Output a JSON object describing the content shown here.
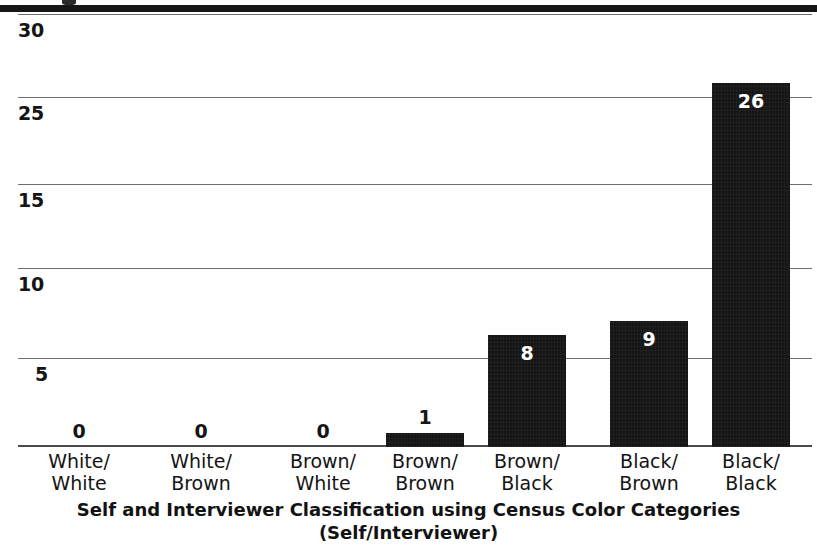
{
  "figure": {
    "top_rule": "horizontal-rule",
    "background_color": "#ffffff",
    "bar_color": "#151515",
    "gridline_color": "#6e6e6e"
  },
  "chart_data": {
    "type": "bar",
    "title": "",
    "xlabel": "Self and Interviewer Classification using Census Color Categories",
    "xlabel_line2": "(Self/Interviewer)",
    "ylabel": "",
    "categories": [
      "White/\nWhite",
      "White/\nBrown",
      "Brown/\nWhite",
      "Brown/\nBrown",
      "Brown/\nBlack",
      "Black/\nBrown",
      "Black/\nBlack"
    ],
    "category_lines": [
      [
        "White/",
        "White"
      ],
      [
        "White/",
        "Brown"
      ],
      [
        "Brown/",
        "White"
      ],
      [
        "Brown/",
        "Brown"
      ],
      [
        "Brown/",
        "Black"
      ],
      [
        "Black/",
        "Brown"
      ],
      [
        "Black/",
        "Black"
      ]
    ],
    "values": [
      0,
      0,
      0,
      1,
      8,
      9,
      26
    ],
    "value_labels": [
      "0",
      "0",
      "0",
      "1",
      "8",
      "9",
      "26"
    ],
    "ylim": [
      0,
      31
    ],
    "yticks": [
      30,
      25,
      15,
      10,
      5
    ],
    "ytick_labels": [
      "30",
      "25",
      "15",
      "10",
      "5"
    ],
    "grid": true,
    "legend": null
  },
  "axis": {
    "y_labels": [
      "30",
      "25",
      "15",
      "10",
      "5"
    ],
    "x_title_line1": "Self and Interviewer Classification using Census Color Categories",
    "x_title_line2": "(Self/Interviewer)"
  }
}
